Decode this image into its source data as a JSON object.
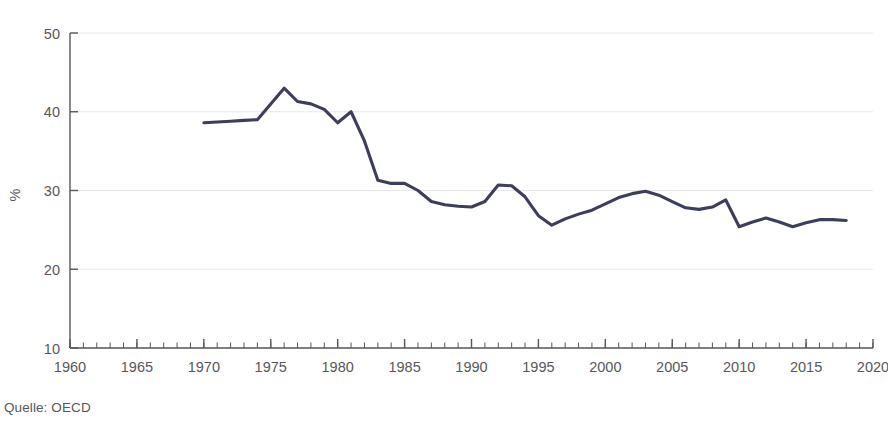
{
  "figure": {
    "title_partial": "",
    "source_note": "Quelle: OECD",
    "line_color": "#3d3d5c",
    "grid_color": "#e8e8ea",
    "axis_color": "#58585a",
    "text_color": "#58585a"
  },
  "chart_data": {
    "type": "line",
    "title": "",
    "xlabel": "",
    "ylabel": "%",
    "xlim": [
      1960,
      2020
    ],
    "ylim": [
      10,
      50
    ],
    "xticks": [
      1960,
      1965,
      1970,
      1975,
      1980,
      1985,
      1990,
      1995,
      2000,
      2005,
      2010,
      2015,
      2020
    ],
    "xtick_labels": [
      "1960",
      "1965",
      "1970",
      "1975",
      "1980",
      "1985",
      "1990",
      "1995",
      "2000",
      "2005",
      "2010",
      "2015",
      "2020"
    ],
    "yticks": [
      10,
      20,
      30,
      40,
      50
    ],
    "ytick_labels": [
      "10",
      "20",
      "30",
      "40",
      "50"
    ],
    "minor_xtick_interval": 1,
    "grid": "horizontal",
    "legend": "none",
    "series": [
      {
        "name": "OECD share",
        "color": "#3d3d5c",
        "x": [
          1970,
          1971,
          1972,
          1973,
          1974,
          1975,
          1976,
          1977,
          1978,
          1979,
          1980,
          1981,
          1982,
          1983,
          1984,
          1985,
          1986,
          1987,
          1988,
          1989,
          1990,
          1991,
          1992,
          1993,
          1994,
          1995,
          1996,
          1997,
          1998,
          1999,
          2000,
          2001,
          2002,
          2003,
          2004,
          2005,
          2006,
          2007,
          2008,
          2009,
          2010,
          2011,
          2012,
          2013,
          2014,
          2015,
          2016,
          2017,
          2018
        ],
        "values": [
          38.6,
          38.7,
          38.8,
          38.9,
          39.0,
          41.0,
          43.0,
          41.3,
          41.0,
          40.3,
          38.6,
          40.0,
          36.3,
          31.3,
          30.9,
          30.9,
          30.0,
          28.6,
          28.2,
          28.0,
          27.9,
          28.6,
          30.7,
          30.6,
          29.2,
          26.8,
          25.6,
          26.4,
          27.0,
          27.5,
          28.3,
          29.1,
          29.6,
          29.9,
          29.4,
          28.6,
          27.8,
          27.6,
          27.9,
          28.8,
          25.4,
          26.0,
          26.5,
          26.0,
          25.4,
          25.9,
          26.3,
          26.3,
          26.2
        ]
      }
    ]
  }
}
